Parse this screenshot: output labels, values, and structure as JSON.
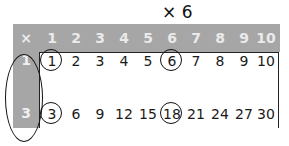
{
  "title": "× 6",
  "header": {
    "corner": "×",
    "columns": [
      "1",
      "2",
      "3",
      "4",
      "5",
      "6",
      "7",
      "8",
      "9",
      "10"
    ]
  },
  "rows": [
    {
      "label": "1",
      "values": [
        "1",
        "2",
        "3",
        "4",
        "5",
        "6",
        "7",
        "8",
        "9",
        "10"
      ]
    },
    {
      "label": "3",
      "values": [
        "3",
        "6",
        "9",
        "12",
        "15",
        "18",
        "21",
        "24",
        "27",
        "30"
      ]
    }
  ],
  "annotations": {
    "circled_columns": [
      "1",
      "6"
    ],
    "circled_row_labels": [
      "1",
      "3"
    ],
    "circled_values": [
      "1",
      "6",
      "3",
      "18"
    ]
  },
  "colors": {
    "header_band": "#a6a6a6",
    "header_text": "#eaeaea",
    "body_text": "#1a1a1a",
    "annotation": "#111111"
  }
}
